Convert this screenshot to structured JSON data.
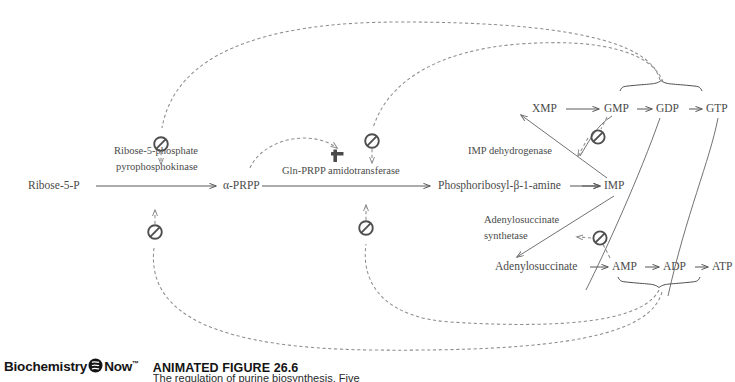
{
  "figure": {
    "brand": "Biochemistry",
    "brand2": "Now",
    "trademark": "™",
    "label": "ANIMATED FIGURE 26.6",
    "caption_clipped": "The regulation of purine biosynthesis. Five"
  },
  "metabolites": {
    "ribose5p": "Ribose-5-P",
    "prpp": "α-PRPP",
    "pra": "Phosphoribosyl-β-1-amine",
    "imp": "IMP",
    "xmp": "XMP",
    "gmp": "GMP",
    "gdp": "GDP",
    "gtp": "GTP",
    "adenylosuccinate": "Adenylosuccinate",
    "amp": "AMP",
    "adp": "ADP",
    "atp": "ATP"
  },
  "enzymes": {
    "r5p_kinase_line1": "Ribose-5-phosphate",
    "r5p_kinase_line2": "pyrophosphokinase",
    "amidotransferase": "Gln-PRPP amidotransferase",
    "imp_dehydrogenase": "IMP dehydrogenase",
    "adss_line1": "Adenylosuccinate",
    "adss_line2": "synthetase"
  },
  "symbols": {
    "inhibition": "⊘",
    "activation": "+"
  },
  "regulation": {
    "inhibitors": [
      {
        "id": "inh-r5pk-top",
        "target": "Ribose-5-phosphate pyrophosphokinase",
        "source": "GMP/GDP/GTP pool"
      },
      {
        "id": "inh-r5pk-bot",
        "target": "Ribose-5-phosphate pyrophosphokinase",
        "source": "AMP/ADP/ATP pool"
      },
      {
        "id": "inh-amido-top",
        "target": "Gln-PRPP amidotransferase",
        "source": "GMP/GDP/GTP pool"
      },
      {
        "id": "inh-amido-bot",
        "target": "Gln-PRPP amidotransferase",
        "source": "AMP/ADP/ATP pool"
      },
      {
        "id": "inh-impdh",
        "target": "IMP dehydrogenase",
        "source": "GMP"
      },
      {
        "id": "inh-adss",
        "target": "Adenylosuccinate synthetase",
        "source": "AMP"
      }
    ],
    "activators": [
      {
        "id": "act-amido",
        "target": "Gln-PRPP amidotransferase",
        "source": "α-PRPP"
      }
    ],
    "cross_activation": [
      {
        "source": "ATP",
        "target": "GMP branch"
      },
      {
        "source": "GTP",
        "target": "AMP branch"
      }
    ]
  },
  "colors": {
    "text": "#4a4a4a",
    "solid_line": "#5a5a5a",
    "dashed_line": "#8d8d8d",
    "symbol": "#4f4f4f",
    "background": "#ffffff",
    "footer_text": "#141414"
  }
}
